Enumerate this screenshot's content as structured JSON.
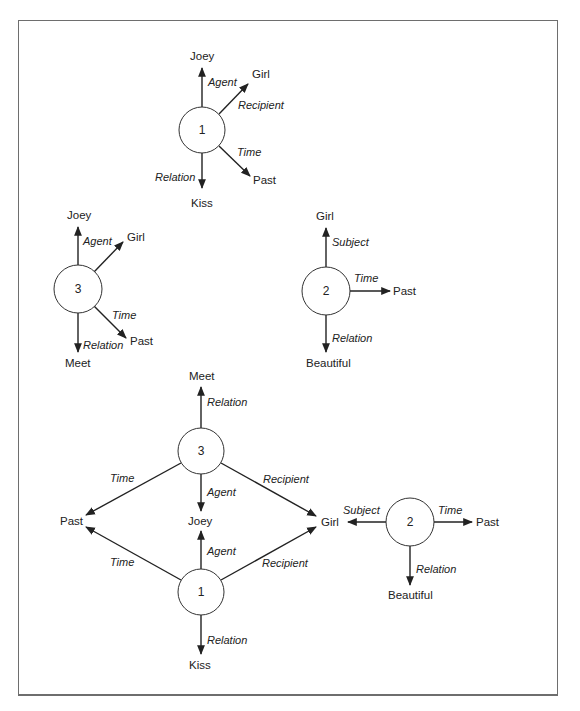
{
  "figure": {
    "colors": {
      "ink": "#222222",
      "frame": "#6e6e6e",
      "background": "#ffffff"
    },
    "diagrams": [
      {
        "name": "proposition-1",
        "node": {
          "label": "1",
          "cx": 202,
          "cy": 130,
          "r": 23
        },
        "edges": [
          {
            "relation": "Agent",
            "target": "Joey",
            "x1": 202,
            "y1": 107,
            "x2": 202,
            "y2": 68,
            "tx": 190,
            "ty": 56,
            "rx": 208,
            "ry": 82
          },
          {
            "relation": "Recipient",
            "target": "Girl",
            "x1": 219,
            "y1": 114,
            "x2": 248,
            "y2": 84,
            "tx": 252,
            "ty": 74,
            "rx": 238,
            "ry": 105
          },
          {
            "relation": "Time",
            "target": "Past",
            "x1": 219,
            "y1": 146,
            "x2": 250,
            "y2": 176,
            "tx": 253,
            "ty": 180,
            "rx": 237,
            "ry": 152
          },
          {
            "relation": "Relation",
            "target": "Kiss",
            "x1": 202,
            "y1": 153,
            "x2": 202,
            "y2": 188,
            "tx": 191,
            "ty": 203,
            "rx": 155,
            "ry": 177
          }
        ]
      },
      {
        "name": "proposition-3",
        "node": {
          "label": "3",
          "cx": 78,
          "cy": 289,
          "r": 24
        },
        "edges": [
          {
            "relation": "Agent",
            "target": "Joey",
            "x1": 78,
            "y1": 265,
            "x2": 78,
            "y2": 227,
            "tx": 67,
            "ty": 215,
            "rx": 83,
            "ry": 241
          },
          {
            "relation": "",
            "target": "Girl",
            "x1": 94,
            "y1": 272,
            "x2": 123,
            "y2": 242,
            "tx": 127,
            "ty": 237,
            "rx": 0,
            "ry": 0
          },
          {
            "relation": "Time",
            "target": "Past",
            "x1": 94,
            "y1": 306,
            "x2": 126,
            "y2": 338,
            "tx": 130,
            "ty": 341,
            "rx": 112,
            "ry": 315
          },
          {
            "relation": "Relation",
            "target": "Meet",
            "x1": 78,
            "y1": 313,
            "x2": 78,
            "y2": 352,
            "tx": 65,
            "ty": 363,
            "rx": 83,
            "ry": 345
          }
        ]
      },
      {
        "name": "proposition-2",
        "node": {
          "label": "2",
          "cx": 326,
          "cy": 291,
          "r": 24
        },
        "edges": [
          {
            "relation": "Subject",
            "target": "Girl",
            "x1": 326,
            "y1": 267,
            "x2": 326,
            "y2": 228,
            "tx": 316,
            "ty": 216,
            "rx": 332,
            "ry": 242
          },
          {
            "relation": "Time",
            "target": "Past",
            "x1": 350,
            "y1": 291,
            "x2": 390,
            "y2": 291,
            "tx": 393,
            "ty": 291,
            "rx": 354,
            "ry": 278
          },
          {
            "relation": "Relation",
            "target": "Beautiful",
            "x1": 326,
            "y1": 315,
            "x2": 326,
            "y2": 352,
            "tx": 306,
            "ty": 363,
            "rx": 332,
            "ry": 338
          }
        ]
      }
    ],
    "network": {
      "name": "combined-network",
      "nodes": [
        {
          "label": "3",
          "cx": 201,
          "cy": 451,
          "r": 23
        },
        {
          "label": "1",
          "cx": 201,
          "cy": 592,
          "r": 23
        },
        {
          "label": "2",
          "cx": 410,
          "cy": 522,
          "r": 24
        }
      ],
      "concepts": [
        {
          "name": "meet",
          "label": "Meet",
          "x": 189,
          "y": 376
        },
        {
          "name": "past",
          "label": "Past",
          "x": 60,
          "y": 521
        },
        {
          "name": "joey",
          "label": "Joey",
          "x": 188,
          "y": 521
        },
        {
          "name": "girl",
          "label": "Girl",
          "x": 321,
          "y": 522
        },
        {
          "name": "past-2",
          "label": "Past",
          "x": 476,
          "y": 522
        },
        {
          "name": "beautiful",
          "label": "Beautiful",
          "x": 388,
          "y": 595
        },
        {
          "name": "kiss",
          "label": "Kiss",
          "x": 189,
          "y": 665
        }
      ],
      "edges": [
        {
          "relation": "Relation",
          "x1": 201,
          "y1": 428,
          "x2": 201,
          "y2": 387,
          "rx": 207,
          "ry": 402
        },
        {
          "relation": "Time",
          "x1": 181,
          "y1": 463,
          "x2": 86,
          "y2": 515,
          "rx": 110,
          "ry": 478
        },
        {
          "relation": "Agent",
          "x1": 201,
          "y1": 474,
          "x2": 201,
          "y2": 511,
          "rx": 207,
          "ry": 492
        },
        {
          "relation": "Recipient",
          "x1": 221,
          "y1": 463,
          "x2": 316,
          "y2": 516,
          "rx": 263,
          "ry": 479
        },
        {
          "relation": "Time",
          "x1": 181,
          "y1": 580,
          "x2": 86,
          "y2": 527,
          "rx": 110,
          "ry": 562
        },
        {
          "relation": "Agent",
          "x1": 201,
          "y1": 569,
          "x2": 201,
          "y2": 531,
          "rx": 207,
          "ry": 551
        },
        {
          "relation": "Recipient",
          "x1": 221,
          "y1": 580,
          "x2": 316,
          "y2": 527,
          "rx": 262,
          "ry": 563
        },
        {
          "relation": "Relation",
          "x1": 201,
          "y1": 615,
          "x2": 201,
          "y2": 654,
          "rx": 207,
          "ry": 640
        },
        {
          "relation": "Subject",
          "x1": 386,
          "y1": 522,
          "x2": 348,
          "y2": 522,
          "rx": 343,
          "ry": 510
        },
        {
          "relation": "Time",
          "x1": 434,
          "y1": 522,
          "x2": 472,
          "y2": 522,
          "rx": 438,
          "ry": 510
        },
        {
          "relation": "Relation",
          "x1": 410,
          "y1": 546,
          "x2": 410,
          "y2": 585,
          "rx": 416,
          "ry": 569
        }
      ]
    }
  }
}
